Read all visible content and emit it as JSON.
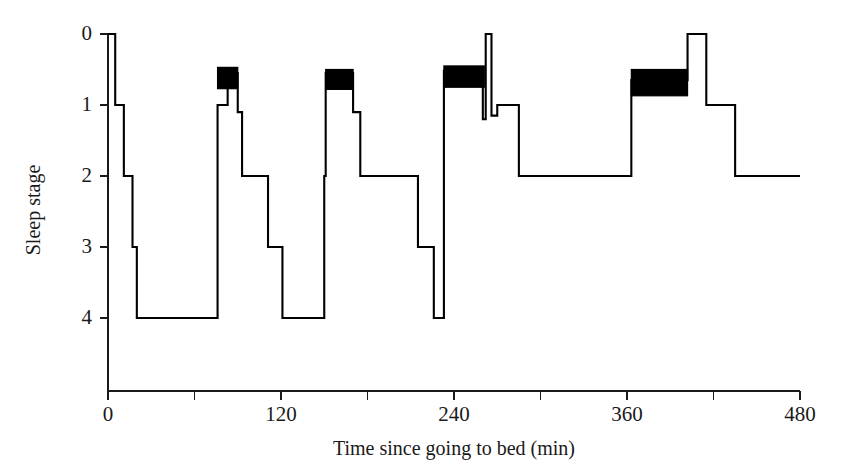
{
  "chart_data": {
    "type": "line",
    "title": "",
    "xlabel": "Time since going to bed (min)",
    "ylabel": "Sleep stage",
    "xlim": [
      0,
      480
    ],
    "ylim": [
      0,
      4
    ],
    "y_inverted": true,
    "grid": false,
    "legend": null,
    "xticks": [
      0,
      60,
      120,
      180,
      240,
      300,
      360,
      420,
      480
    ],
    "xtick_labels": [
      "0",
      "",
      "120",
      "",
      "240",
      "",
      "360",
      "",
      "480"
    ],
    "yticks": [
      0,
      1,
      2,
      3,
      4
    ],
    "ytick_labels": [
      "0",
      "1",
      "2",
      "3",
      "4"
    ],
    "stage_steps": [
      {
        "start": 0,
        "end": 5,
        "stage": 0
      },
      {
        "start": 5,
        "end": 11,
        "stage": 1
      },
      {
        "start": 11,
        "end": 17,
        "stage": 2
      },
      {
        "start": 17,
        "end": 20,
        "stage": 3
      },
      {
        "start": 20,
        "end": 76,
        "stage": 4
      },
      {
        "start": 76,
        "end": 83,
        "stage": 1
      },
      {
        "start": 83,
        "end": 90,
        "stage": 0.55
      },
      {
        "start": 90,
        "end": 93,
        "stage": 1.1
      },
      {
        "start": 93,
        "end": 111,
        "stage": 2
      },
      {
        "start": 111,
        "end": 121,
        "stage": 3
      },
      {
        "start": 121,
        "end": 150,
        "stage": 4
      },
      {
        "start": 150,
        "end": 151,
        "stage": 2
      },
      {
        "start": 151,
        "end": 170,
        "stage": 0.55
      },
      {
        "start": 170,
        "end": 175,
        "stage": 1.1
      },
      {
        "start": 175,
        "end": 215,
        "stage": 2
      },
      {
        "start": 215,
        "end": 226,
        "stage": 3
      },
      {
        "start": 226,
        "end": 233,
        "stage": 4
      },
      {
        "start": 233,
        "end": 260,
        "stage": 0.52
      },
      {
        "start": 260,
        "end": 262,
        "stage": 1.2
      },
      {
        "start": 262,
        "end": 266,
        "stage": 0
      },
      {
        "start": 266,
        "end": 270,
        "stage": 1.15
      },
      {
        "start": 270,
        "end": 285,
        "stage": 1
      },
      {
        "start": 285,
        "end": 363,
        "stage": 2
      },
      {
        "start": 363,
        "end": 402,
        "stage": 0.65
      },
      {
        "start": 402,
        "end": 415,
        "stage": 0
      },
      {
        "start": 415,
        "end": 435,
        "stage": 1
      },
      {
        "start": 435,
        "end": 480,
        "stage": 2
      }
    ],
    "rem_episodes": [
      {
        "start": 76,
        "end": 90,
        "top_stage": 0.47,
        "bottom_stage": 0.77
      },
      {
        "start": 151,
        "end": 170,
        "top_stage": 0.5,
        "bottom_stage": 0.78
      },
      {
        "start": 233,
        "end": 261,
        "top_stage": 0.45,
        "bottom_stage": 0.75
      },
      {
        "start": 363,
        "end": 402,
        "top_stage": 0.5,
        "bottom_stage": 0.87
      }
    ]
  }
}
